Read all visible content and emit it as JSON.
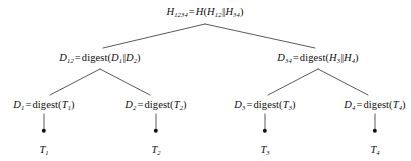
{
  "figure": {
    "type": "merkle-tree-diagram",
    "background_color": "#ffffff",
    "line_color": "#3a3a46",
    "text_color": "#0d0d0d",
    "width": 411,
    "height": 161
  },
  "nodes": {
    "root": {
      "name": "H_1234",
      "text": "H1234 = H(H12||H34)",
      "base": "H",
      "sub": "1234",
      "expr_fn": "H",
      "arg_left_base": "H",
      "arg_left_sub": "12",
      "arg_right_base": "H",
      "arg_right_sub": "34",
      "x": 205,
      "y": 12
    },
    "internal": [
      {
        "name": "D_12",
        "text": "D12 = digest(D1||D2)",
        "base": "D",
        "sub": "12",
        "expr_fn": "digest",
        "arg_left_base": "D",
        "arg_left_sub": "1",
        "arg_right_base": "D",
        "arg_right_sub": "2",
        "x": 100,
        "y": 58
      },
      {
        "name": "D_34",
        "text": "D34 = digest(H3||H4)",
        "base": "D",
        "sub": "34",
        "expr_fn": "digest",
        "arg_left_base": "H",
        "arg_left_sub": "3",
        "arg_right_base": "H",
        "arg_right_sub": "4",
        "x": 318,
        "y": 58
      }
    ],
    "leaves": [
      {
        "name": "D_1",
        "text": "D1 = digest(T1)",
        "base": "D",
        "sub": "1",
        "expr_fn": "digest",
        "arg_base": "T",
        "arg_sub": "1",
        "x": 44,
        "y": 105
      },
      {
        "name": "D_2",
        "text": "D2 = digest(T2)",
        "base": "D",
        "sub": "2",
        "expr_fn": "digest",
        "arg_base": "T",
        "arg_sub": "2",
        "x": 156,
        "y": 105
      },
      {
        "name": "D_3",
        "text": "D3 = digest(T3)",
        "base": "D",
        "sub": "3",
        "expr_fn": "digest",
        "arg_base": "T",
        "arg_sub": "3",
        "x": 265,
        "y": 105
      },
      {
        "name": "D_4",
        "text": "D4 = digest(T4)",
        "base": "D",
        "sub": "4",
        "expr_fn": "digest",
        "arg_base": "T",
        "arg_sub": "4",
        "x": 375,
        "y": 105
      }
    ],
    "transactions": [
      {
        "name": "T_1",
        "text": "T1",
        "base": "T",
        "sub": "1",
        "x": 44,
        "y": 150,
        "dot_x": 44,
        "dot_y": 131
      },
      {
        "name": "T_2",
        "text": "T2",
        "base": "T",
        "sub": "2",
        "x": 156,
        "y": 150,
        "dot_x": 156,
        "dot_y": 131
      },
      {
        "name": "T_3",
        "text": "T3",
        "base": "T",
        "sub": "3",
        "x": 265,
        "y": 150,
        "dot_x": 265,
        "dot_y": 131
      },
      {
        "name": "T_4",
        "text": "T4",
        "base": "T",
        "sub": "4",
        "x": 375,
        "y": 150,
        "dot_x": 375,
        "dot_y": 131
      }
    ]
  },
  "symbols": {
    "equals": "=",
    "concat": "||",
    "paren_open": "(",
    "paren_close": ")"
  }
}
